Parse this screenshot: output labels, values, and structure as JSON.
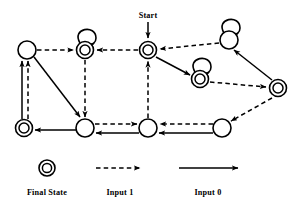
{
  "diagram": {
    "type": "state-machine",
    "background_color": "#ffffff",
    "stroke_color": "#000000",
    "start_label": "Start",
    "states": [
      {
        "id": "s_topleft",
        "cx": 27,
        "cy": 50,
        "r": 9,
        "final": false,
        "self_loop": false
      },
      {
        "id": "s_topmid",
        "cx": 85,
        "cy": 50,
        "r": 8.5,
        "final": true,
        "self_loop": true
      },
      {
        "id": "s_start",
        "cx": 148,
        "cy": 50,
        "r": 8.5,
        "final": true,
        "self_loop": false
      },
      {
        "id": "s_topright",
        "cx": 229,
        "cy": 40,
        "r": 9,
        "final": false,
        "self_loop": true
      },
      {
        "id": "s_midright",
        "cx": 200,
        "cy": 79,
        "r": 8.5,
        "final": true,
        "self_loop": true
      },
      {
        "id": "s_farright",
        "cx": 278,
        "cy": 88,
        "r": 8.5,
        "final": true,
        "self_loop": false
      },
      {
        "id": "s_botleft",
        "cx": 24,
        "cy": 128,
        "r": 8.5,
        "final": true,
        "self_loop": false
      },
      {
        "id": "s_botmid1",
        "cx": 85,
        "cy": 128,
        "r": 9,
        "final": false,
        "self_loop": false
      },
      {
        "id": "s_botmid2",
        "cx": 148,
        "cy": 128,
        "r": 9,
        "final": false,
        "self_loop": false
      },
      {
        "id": "s_botright",
        "cx": 222,
        "cy": 128,
        "r": 9,
        "final": false,
        "self_loop": false
      }
    ],
    "transitions": [
      {
        "from": "s_topleft",
        "to": "s_topmid",
        "input": "1"
      },
      {
        "from": "s_start",
        "to": "s_topmid",
        "input": "1"
      },
      {
        "from": "s_topmid",
        "to": "s_topmid",
        "input": "1"
      },
      {
        "from": "s_topright",
        "to": "s_start",
        "input": "1"
      },
      {
        "from": "s_botmid2",
        "to": "s_start",
        "input": "1"
      },
      {
        "from": "s_topright",
        "to": "s_topright",
        "input": "1"
      },
      {
        "from": "s_midright",
        "to": "s_midright",
        "input": "1"
      },
      {
        "from": "s_midright",
        "to": "s_farright",
        "input": "1"
      },
      {
        "from": "s_farright",
        "to": "s_botright",
        "input": "1"
      },
      {
        "from": "s_botright",
        "to": "s_botmid2",
        "input": "1"
      },
      {
        "from": "s_botmid1",
        "to": "s_botmid2",
        "input": "1"
      },
      {
        "from": "s_topmid",
        "to": "s_botmid1",
        "input": "1"
      },
      {
        "from": "s_botleft",
        "to": "s_topleft",
        "input": "1"
      },
      {
        "from": "s_botleft",
        "to": "s_topleft",
        "input": "0"
      },
      {
        "from": "s_topleft",
        "to": "s_botmid1",
        "input": "0"
      },
      {
        "from": "s_start",
        "to": "s_midright",
        "input": "0"
      },
      {
        "from": "s_farright",
        "to": "s_topright",
        "input": "0"
      },
      {
        "from": "s_botright",
        "to": "s_botmid2",
        "input": "0"
      },
      {
        "from": "s_botmid2",
        "to": "s_botmid1",
        "input": "0"
      },
      {
        "from": "s_botmid1",
        "to": "s_botleft",
        "input": "0"
      }
    ]
  },
  "legend": {
    "final_state_label": "Final State",
    "input1_label": "Input 1",
    "input0_label": "Input 0",
    "final_state_symbol": "double-circle-icon",
    "input1_symbol": "dashed-arrow-icon",
    "input0_symbol": "solid-arrow-icon"
  }
}
